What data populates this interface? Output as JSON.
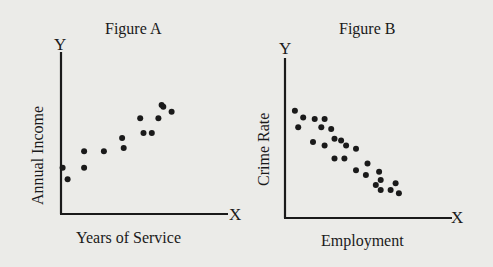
{
  "chart_data": [
    {
      "type": "scatter",
      "title": "Figure A",
      "xlabel": "Years of Service",
      "ylabel": "Annual Income",
      "x_axis_letter": "X",
      "y_axis_letter": "Y",
      "xlim": [
        0,
        10
      ],
      "ylim": [
        0,
        10
      ],
      "grid": false,
      "ticks": "none",
      "trend": "positive correlation",
      "points": [
        {
          "x": 0.1,
          "y": 2.8
        },
        {
          "x": 0.4,
          "y": 2.1
        },
        {
          "x": 1.4,
          "y": 3.8
        },
        {
          "x": 1.4,
          "y": 2.8
        },
        {
          "x": 2.6,
          "y": 3.8
        },
        {
          "x": 3.7,
          "y": 4.6
        },
        {
          "x": 3.8,
          "y": 4.0
        },
        {
          "x": 4.8,
          "y": 5.8
        },
        {
          "x": 5.0,
          "y": 4.9
        },
        {
          "x": 5.5,
          "y": 4.9
        },
        {
          "x": 5.9,
          "y": 5.8
        },
        {
          "x": 6.1,
          "y": 6.6
        },
        {
          "x": 6.2,
          "y": 6.5
        },
        {
          "x": 6.7,
          "y": 6.2
        }
      ]
    },
    {
      "type": "scatter",
      "title": "Figure B",
      "xlabel": "Employment",
      "ylabel": "Crime Rate",
      "x_axis_letter": "X",
      "y_axis_letter": "Y",
      "xlim": [
        0,
        10
      ],
      "ylim": [
        0,
        10
      ],
      "grid": false,
      "ticks": "none",
      "trend": "negative correlation",
      "points": [
        {
          "x": 0.6,
          "y": 6.5
        },
        {
          "x": 1.1,
          "y": 6.1
        },
        {
          "x": 0.8,
          "y": 5.5
        },
        {
          "x": 1.8,
          "y": 6.0
        },
        {
          "x": 2.4,
          "y": 6.0
        },
        {
          "x": 2.2,
          "y": 5.5
        },
        {
          "x": 1.7,
          "y": 4.6
        },
        {
          "x": 2.4,
          "y": 4.4
        },
        {
          "x": 2.8,
          "y": 5.4
        },
        {
          "x": 3.0,
          "y": 4.8
        },
        {
          "x": 3.4,
          "y": 4.7
        },
        {
          "x": 3.7,
          "y": 4.4
        },
        {
          "x": 3.0,
          "y": 3.6
        },
        {
          "x": 3.6,
          "y": 3.6
        },
        {
          "x": 4.3,
          "y": 4.2
        },
        {
          "x": 4.3,
          "y": 2.9
        },
        {
          "x": 5.0,
          "y": 3.3
        },
        {
          "x": 4.9,
          "y": 2.6
        },
        {
          "x": 5.7,
          "y": 2.8
        },
        {
          "x": 5.8,
          "y": 2.3
        },
        {
          "x": 5.5,
          "y": 2.0
        },
        {
          "x": 5.8,
          "y": 1.7
        },
        {
          "x": 6.4,
          "y": 1.7
        },
        {
          "x": 6.7,
          "y": 2.1
        },
        {
          "x": 6.9,
          "y": 1.5
        }
      ]
    }
  ]
}
